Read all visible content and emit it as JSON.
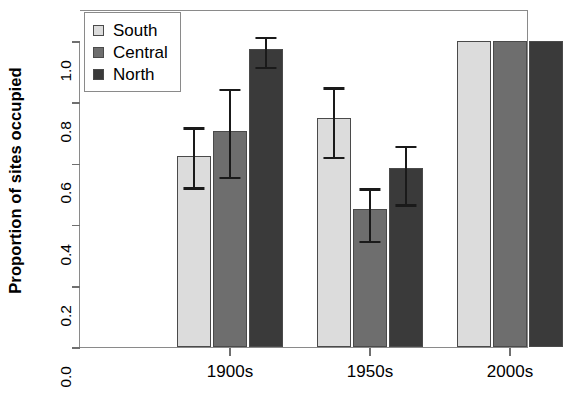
{
  "chart_data": {
    "type": "bar",
    "title": "",
    "xlabel": "",
    "ylabel": "Proportion of sites occupied",
    "categories": [
      "1900s",
      "1950s",
      "2000s"
    ],
    "ylim": [
      0.0,
      1.0
    ],
    "yticks": [
      "0.0",
      "0.2",
      "0.4",
      "0.6",
      "0.8",
      "1.0"
    ],
    "ytick_values": [
      0.0,
      0.2,
      0.4,
      0.6,
      0.8,
      1.0
    ],
    "grid": false,
    "legend_position": "top-left",
    "error_bars": "whisker-capped",
    "series": [
      {
        "name": "South",
        "color": "#dcdcdc",
        "values": [
          0.625,
          0.75,
          1.0
        ],
        "err_low": [
          0.52,
          0.62,
          null
        ],
        "err_high": [
          0.725,
          0.855,
          null
        ]
      },
      {
        "name": "Central",
        "color": "#6e6e6e",
        "values": [
          0.705,
          0.45,
          1.0
        ],
        "err_low": [
          0.555,
          0.345,
          null
        ],
        "err_high": [
          0.85,
          0.525,
          null
        ]
      },
      {
        "name": "North",
        "color": "#3a3a3a",
        "values": [
          0.975,
          0.585,
          1.0
        ],
        "err_low": [
          0.915,
          0.465,
          null
        ],
        "err_high": [
          1.02,
          0.665,
          null
        ]
      }
    ]
  },
  "legend": {
    "items": [
      {
        "label": "South",
        "color": "#dcdcdc"
      },
      {
        "label": "Central",
        "color": "#6e6e6e"
      },
      {
        "label": "North",
        "color": "#3a3a3a"
      }
    ]
  },
  "axes": {
    "y_title": "Proportion of sites occupied",
    "y_tick_labels": [
      "0.0",
      "0.2",
      "0.4",
      "0.6",
      "0.8",
      "1.0"
    ],
    "x_tick_labels": [
      "1900s",
      "1950s",
      "2000s"
    ]
  }
}
